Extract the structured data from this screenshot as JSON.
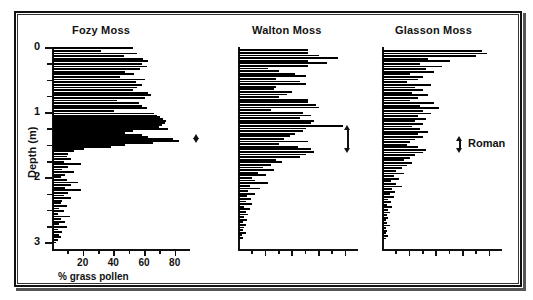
{
  "figure": {
    "axis_label_y": "Depth (m)",
    "axis_label_x": "% grass pollen",
    "y_ticks_major": [
      "0",
      "1",
      "2",
      "3"
    ],
    "x_ticks_major": [
      "20",
      "40",
      "60",
      "80"
    ]
  },
  "chart_data": {
    "type": "bar",
    "orientation": "horizontal",
    "title": "",
    "xlabel": "% grass pollen",
    "ylabel": "Depth (m)",
    "xlim": [
      0,
      90
    ],
    "ylim": [
      0,
      3.1
    ],
    "y_inverted": true,
    "grid": false,
    "legend": "none",
    "axis_ticks": {
      "y_major": [
        0,
        1,
        2,
        3
      ],
      "y_minor": [
        0.25,
        0.5,
        0.75,
        1.25,
        1.5,
        1.75,
        2.25,
        2.5,
        2.75
      ],
      "x_major": [
        20,
        40,
        60,
        80
      ],
      "x_minor": [
        10,
        30,
        50,
        70
      ]
    },
    "panels": [
      {
        "name": "Fozy Moss",
        "x_tick_labels_shown": true,
        "annotation": {
          "label": "",
          "depth_from": 1.33,
          "depth_to": 1.47
        },
        "depths": [
          0.02,
          0.06,
          0.1,
          0.14,
          0.18,
          0.22,
          0.26,
          0.3,
          0.34,
          0.38,
          0.42,
          0.46,
          0.5,
          0.54,
          0.58,
          0.62,
          0.66,
          0.7,
          0.74,
          0.78,
          0.82,
          0.86,
          0.9,
          0.94,
          0.98,
          1.02,
          1.05,
          1.08,
          1.11,
          1.14,
          1.17,
          1.2,
          1.23,
          1.26,
          1.29,
          1.32,
          1.35,
          1.38,
          1.41,
          1.44,
          1.47,
          1.5,
          1.53,
          1.56,
          1.6,
          1.64,
          1.68,
          1.72,
          1.76,
          1.8,
          1.84,
          1.88,
          1.92,
          1.96,
          2.0,
          2.04,
          2.08,
          2.12,
          2.16,
          2.2,
          2.24,
          2.28,
          2.32,
          2.36,
          2.4,
          2.44,
          2.48,
          2.52,
          2.56,
          2.6,
          2.64,
          2.68,
          2.72,
          2.76,
          2.8,
          2.84,
          2.88,
          2.92,
          2.96,
          3.0
        ],
        "values": [
          52,
          31,
          55,
          46,
          59,
          62,
          58,
          61,
          57,
          47,
          53,
          44,
          60,
          54,
          58,
          55,
          52,
          62,
          64,
          60,
          42,
          56,
          58,
          61,
          40,
          66,
          68,
          70,
          72,
          74,
          73,
          71,
          69,
          75,
          52,
          47,
          58,
          62,
          78,
          82,
          65,
          47,
          38,
          20,
          14,
          10,
          9,
          12,
          7,
          18,
          10,
          6,
          14,
          8,
          5,
          9,
          16,
          12,
          8,
          18,
          10,
          7,
          12,
          6,
          5,
          9,
          4,
          7,
          3,
          11,
          5,
          8,
          4,
          9,
          3,
          6,
          4,
          5,
          3,
          2
        ]
      },
      {
        "name": "Walton Moss",
        "x_tick_labels_shown": false,
        "annotation": {
          "label": "",
          "depth_from": 1.2,
          "depth_to": 1.62
        },
        "depths": [
          0.05,
          0.09,
          0.13,
          0.17,
          0.21,
          0.25,
          0.29,
          0.33,
          0.37,
          0.41,
          0.45,
          0.49,
          0.53,
          0.57,
          0.61,
          0.65,
          0.69,
          0.73,
          0.77,
          0.81,
          0.85,
          0.89,
          0.93,
          0.97,
          1.01,
          1.05,
          1.09,
          1.13,
          1.17,
          1.21,
          1.25,
          1.29,
          1.33,
          1.37,
          1.41,
          1.45,
          1.49,
          1.53,
          1.57,
          1.61,
          1.65,
          1.69,
          1.73,
          1.77,
          1.81,
          1.85,
          1.89,
          1.93,
          1.97,
          2.01,
          2.05,
          2.09,
          2.13,
          2.17,
          2.21,
          2.25,
          2.29,
          2.33,
          2.37,
          2.41,
          2.45,
          2.49,
          2.53,
          2.57,
          2.61,
          2.65,
          2.69,
          2.73,
          2.77,
          2.81,
          2.85,
          2.89,
          2.93
        ],
        "values": [
          52,
          52,
          60,
          74,
          52,
          66,
          52,
          22,
          30,
          42,
          50,
          28,
          46,
          50,
          28,
          26,
          40,
          36,
          30,
          52,
          52,
          58,
          60,
          24,
          48,
          54,
          46,
          56,
          54,
          78,
          50,
          48,
          42,
          38,
          34,
          52,
          30,
          44,
          54,
          56,
          50,
          46,
          28,
          32,
          24,
          18,
          26,
          14,
          20,
          10,
          12,
          22,
          8,
          16,
          7,
          12,
          6,
          9,
          5,
          10,
          4,
          8,
          5,
          7,
          4,
          6,
          3,
          5,
          4,
          3,
          5,
          2,
          3
        ]
      },
      {
        "name": "Glasson Moss",
        "x_tick_labels_shown": false,
        "annotation": {
          "label": "Roman",
          "depth_from": 1.36,
          "depth_to": 1.62
        },
        "depths": [
          0.06,
          0.1,
          0.14,
          0.18,
          0.22,
          0.26,
          0.3,
          0.34,
          0.38,
          0.42,
          0.46,
          0.5,
          0.54,
          0.58,
          0.62,
          0.66,
          0.7,
          0.74,
          0.78,
          0.82,
          0.86,
          0.9,
          0.94,
          0.98,
          1.02,
          1.06,
          1.1,
          1.14,
          1.18,
          1.22,
          1.26,
          1.3,
          1.34,
          1.38,
          1.42,
          1.46,
          1.5,
          1.54,
          1.58,
          1.62,
          1.66,
          1.7,
          1.74,
          1.78,
          1.82,
          1.86,
          1.9,
          1.94,
          1.98,
          2.02,
          2.06,
          2.1,
          2.14,
          2.18,
          2.22,
          2.26,
          2.3,
          2.34,
          2.38,
          2.42,
          2.46,
          2.5,
          2.54,
          2.58,
          2.62,
          2.66,
          2.7,
          2.74,
          2.78,
          2.82,
          2.86,
          2.9,
          2.94
        ],
        "values": [
          74,
          78,
          70,
          34,
          50,
          28,
          44,
          32,
          38,
          20,
          30,
          26,
          18,
          36,
          24,
          30,
          22,
          34,
          26,
          20,
          38,
          28,
          42,
          30,
          36,
          26,
          32,
          24,
          30,
          22,
          28,
          34,
          26,
          30,
          24,
          20,
          18,
          26,
          32,
          30,
          24,
          20,
          16,
          22,
          18,
          14,
          10,
          16,
          8,
          12,
          6,
          10,
          14,
          7,
          9,
          5,
          8,
          4,
          6,
          3,
          7,
          4,
          5,
          3,
          4,
          2,
          3,
          5,
          2,
          3,
          2,
          4,
          2
        ]
      }
    ]
  }
}
